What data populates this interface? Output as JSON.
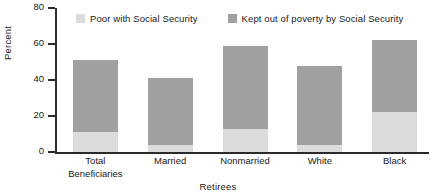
{
  "chart_data": {
    "type": "bar",
    "stacked": true,
    "title": "",
    "xlabel": "Retirees",
    "ylabel": "Percent",
    "ylim": [
      0,
      80
    ],
    "yticks": [
      0,
      20,
      40,
      60,
      80
    ],
    "grid": false,
    "legend_position": "top",
    "categories": [
      "Total\nBeneficiaries",
      "Married",
      "Nonmarried",
      "White",
      "Black"
    ],
    "series": [
      {
        "name": "Poor with Social Security",
        "color": "#dcdcdc",
        "values": [
          11,
          4,
          13,
          4,
          22
        ]
      },
      {
        "name": "Kept out of poverty by Social Security",
        "color": "#a0a0a0",
        "values": [
          40,
          37,
          46,
          44,
          40
        ]
      }
    ],
    "totals": [
      51,
      41,
      59,
      48,
      62
    ]
  },
  "axes": {
    "y_title": "Percent",
    "x_title": "Retirees",
    "y_tick_labels": [
      "0",
      "20",
      "40",
      "60",
      "80"
    ]
  },
  "legend": {
    "entries": [
      {
        "label": "Poor with Social Security",
        "color": "#dcdcdc"
      },
      {
        "label": "Kept out of poverty by Social Security",
        "color": "#a0a0a0"
      }
    ]
  }
}
